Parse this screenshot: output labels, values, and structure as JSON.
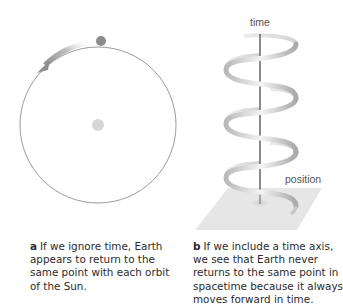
{
  "panel_a": {
    "label": "a",
    "caption": "If we ignore time, Earth appears to return to the same point with each orbit of the Sun.",
    "orbit": {
      "cx": 98,
      "cy": 125,
      "r": 78,
      "color": "#9a9a9a"
    },
    "earth": {
      "cx": 101,
      "cy": 41,
      "r": 5,
      "color": "#8c8c8c"
    },
    "sun": {
      "cx": 98,
      "cy": 125,
      "r": 6,
      "color": "#d6d6d6"
    },
    "arrow_direction": "counter-clockwise"
  },
  "panel_b": {
    "label": "b",
    "caption": "If we include a time axis, we see that Earth never returns to the same point in spacetime because it always moves forward in time.",
    "time_axis_label": "time",
    "position_label": "position",
    "helix_turns": 3.5,
    "colors": {
      "axis": "#6e6e6e",
      "helix_dark": "#a8a8a8",
      "helix_light": "#efefef",
      "plane": "#e6e6e6"
    }
  }
}
